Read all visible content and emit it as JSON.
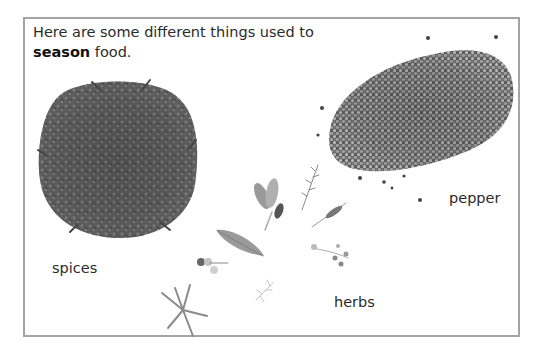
{
  "intro": {
    "line1": "Here are some different things used to",
    "bold_word": "season",
    "line2_rest": " food."
  },
  "labels": {
    "spices": "spices",
    "pepper": "pepper",
    "herbs": "herbs"
  },
  "images": {
    "spices": "cloves-pile",
    "pepper": "peppercorn-pile",
    "herbs": [
      "sage-leaves",
      "rosemary-sprig",
      "thyme-sprig",
      "bay-leaf",
      "flower-sprig",
      "star-sprig",
      "dill-sprig",
      "oregano-sprig"
    ]
  },
  "colors": {
    "frame": "#a4a4a4",
    "text": "#2b2b2b"
  }
}
